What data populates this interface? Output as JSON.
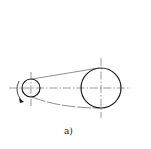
{
  "diagram": {
    "caption": "a)",
    "colors": {
      "stroke": "#1a1a1a",
      "centerline": "#555555",
      "belt": "#444444",
      "background": "#ffffff"
    },
    "small_pulley": {
      "cx": 31,
      "cy": 88,
      "r": 9,
      "rotation": "counterclockwise-arrow"
    },
    "large_pulley": {
      "cx": 101,
      "cy": 88,
      "r": 20
    },
    "belt": "open belt drive connecting both pulleys"
  }
}
